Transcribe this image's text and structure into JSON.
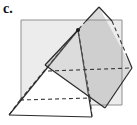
{
  "panel": {
    "label": "c."
  },
  "figure": {
    "width": 137,
    "height": 125,
    "dash": "4 3",
    "colors": {
      "background": "#ffffff",
      "plane_fill": "#ececec",
      "plane_stroke": "#8f8f8f",
      "edge": "#2b2b2b",
      "hidden_edge": "#3a3a3a",
      "pyramid_fill": "#ffffff",
      "plane2_fill": "rgba(140,140,140,0.30)",
      "dot": "#1a1a1a",
      "label_color": "#111111"
    },
    "shapes": [
      {
        "kind": "polygon",
        "name": "frontal-plane",
        "points": [
          [
            21,
            20
          ],
          [
            122,
            20
          ],
          [
            122,
            105
          ],
          [
            21,
            105
          ]
        ],
        "fill": "plane_fill",
        "stroke": "plane_stroke",
        "width": 1
      },
      {
        "kind": "polygon",
        "name": "pyramid-front-faces",
        "points": [
          [
            78,
            30
          ],
          [
            92,
            117
          ],
          [
            9,
            115
          ]
        ],
        "fill": "pyramid_fill",
        "stroke": "none",
        "width": 0
      },
      {
        "kind": "polyline",
        "name": "pyramid-hidden-back-left-edge",
        "points": [
          [
            20,
            100
          ],
          [
            9,
            115
          ]
        ],
        "stroke": "hidden_edge",
        "width": 1.1,
        "dashed": true
      },
      {
        "kind": "polyline",
        "name": "pyramid-hidden-back-base-edge",
        "points": [
          [
            20,
            100
          ],
          [
            90,
            98
          ]
        ],
        "stroke": "hidden_edge",
        "width": 1.1,
        "dashed": true
      },
      {
        "kind": "polyline",
        "name": "pyramid-hidden-back-right-edge",
        "points": [
          [
            90,
            98
          ],
          [
            92,
            117
          ]
        ],
        "stroke": "hidden_edge",
        "width": 1.1,
        "dashed": true
      },
      {
        "kind": "polyline",
        "name": "pyramid-hidden-left-lateral-edge",
        "points": [
          [
            20,
            100
          ],
          [
            78,
            30
          ]
        ],
        "stroke": "hidden_edge",
        "width": 1.1,
        "dashed": true
      },
      {
        "kind": "polyline",
        "name": "pyramid-hidden-right-lateral-edge",
        "points": [
          [
            90,
            98
          ],
          [
            78,
            30
          ]
        ],
        "stroke": "hidden_edge",
        "width": 1.1,
        "dashed": true
      },
      {
        "kind": "polyline",
        "name": "pyramid-left-edge",
        "points": [
          [
            78,
            30
          ],
          [
            9,
            115
          ]
        ],
        "stroke": "edge",
        "width": 1.2
      },
      {
        "kind": "polyline",
        "name": "pyramid-base-front-edge",
        "points": [
          [
            9,
            115
          ],
          [
            92,
            117
          ]
        ],
        "stroke": "edge",
        "width": 1.2
      },
      {
        "kind": "polyline",
        "name": "pyramid-right-edge",
        "points": [
          [
            78,
            30
          ],
          [
            92,
            117
          ]
        ],
        "stroke": "edge",
        "width": 1.2
      },
      {
        "kind": "polygon",
        "name": "tilted-plane",
        "points": [
          [
            99,
            7
          ],
          [
            132,
            68
          ],
          [
            105,
            108
          ],
          [
            45,
            65
          ]
        ],
        "fill": "plane2_fill",
        "stroke": "none",
        "width": 0
      },
      {
        "kind": "polyline",
        "name": "tilted-plane-top-left-edge-visible",
        "points": [
          [
            99,
            7
          ],
          [
            86,
            21
          ]
        ],
        "stroke": "edge",
        "width": 1.2
      },
      {
        "kind": "polyline",
        "name": "tilted-plane-top-left-edge-hidden",
        "points": [
          [
            86,
            21
          ],
          [
            78,
            30
          ]
        ],
        "stroke": "hidden_edge",
        "width": 1.1,
        "dashed": true
      },
      {
        "kind": "polyline",
        "name": "tilted-plane-left-edge-front",
        "points": [
          [
            78,
            30
          ],
          [
            45,
            65
          ]
        ],
        "stroke": "edge",
        "width": 1.2
      },
      {
        "kind": "polyline",
        "name": "tilted-plane-top-right-edge-visible",
        "points": [
          [
            99,
            7
          ],
          [
            112,
            21
          ]
        ],
        "stroke": "edge",
        "width": 1.2
      },
      {
        "kind": "polyline",
        "name": "tilted-plane-top-right-edge-hidden",
        "points": [
          [
            112,
            21
          ],
          [
            127,
            56
          ]
        ],
        "stroke": "hidden_edge",
        "width": 1.1,
        "dashed": true
      },
      {
        "kind": "polyline",
        "name": "tilted-plane-right-corner-edge",
        "points": [
          [
            127,
            56
          ],
          [
            132,
            68
          ]
        ],
        "stroke": "edge",
        "width": 1.2
      },
      {
        "kind": "polyline",
        "name": "tilted-plane-lower-right-edge",
        "points": [
          [
            132,
            68
          ],
          [
            105,
            108
          ]
        ],
        "stroke": "edge",
        "width": 1.2
      },
      {
        "kind": "polyline",
        "name": "tilted-plane-lower-left-edge",
        "points": [
          [
            45,
            65
          ],
          [
            105,
            108
          ]
        ],
        "stroke": "edge",
        "width": 1.2
      },
      {
        "kind": "polyline",
        "name": "plane-intersection-hidden-line",
        "points": [
          [
            48,
            71
          ],
          [
            131,
            68
          ]
        ],
        "stroke": "hidden_edge",
        "width": 1.1,
        "dashed": true
      },
      {
        "kind": "circle",
        "name": "piercing-point",
        "cx": 78,
        "cy": 30,
        "r": 2,
        "fill": "dot"
      }
    ]
  }
}
